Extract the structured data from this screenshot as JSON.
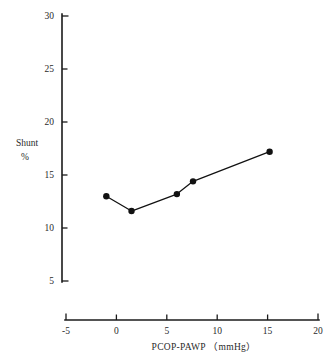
{
  "chart_data": {
    "type": "line",
    "title": "",
    "xlabel": "PCOP-PAWP （mmHg）",
    "ylabel_line1": "Shunt",
    "ylabel_line2": "%",
    "xlim": [
      -5,
      20
    ],
    "ylim": [
      5,
      30
    ],
    "xticks": [
      -5,
      0,
      5,
      10,
      15,
      20
    ],
    "xtick_labels": [
      "-5",
      "0",
      "5",
      "10",
      "15",
      "20"
    ],
    "yticks": [
      5,
      10,
      15,
      20,
      25,
      30
    ],
    "ytick_labels": [
      "5",
      "10",
      "15",
      "20",
      "25",
      "30"
    ],
    "grid": false,
    "legend": "none",
    "marker": "filled-circle",
    "series": [
      {
        "name": "Shunt fraction",
        "x": [
          -1.0,
          1.5,
          6.0,
          7.6,
          15.2
        ],
        "y": [
          13.0,
          11.6,
          13.2,
          14.4,
          17.2
        ]
      }
    ],
    "points": [
      {
        "x": -1.0,
        "y": 13.0
      },
      {
        "x": 1.5,
        "y": 11.6
      },
      {
        "x": 6.0,
        "y": 13.2
      },
      {
        "x": 7.6,
        "y": 14.4
      },
      {
        "x": 15.2,
        "y": 17.2
      }
    ],
    "colors": {
      "axis": "#1a1a1a",
      "line": "#111111",
      "marker": "#111111",
      "text": "#2a2a2a",
      "background": "#ffffff"
    }
  }
}
